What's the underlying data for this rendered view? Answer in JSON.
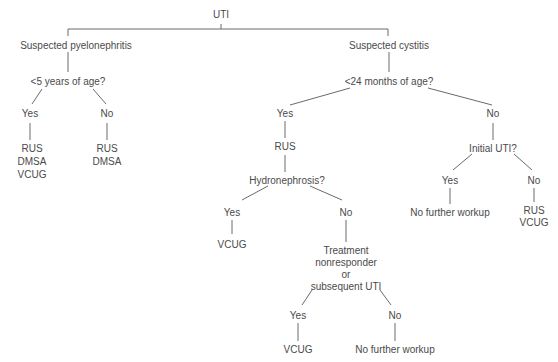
{
  "diagram": {
    "type": "decision-tree",
    "root": "UTI",
    "nodes": {
      "root": "UTI",
      "pyelo": "Suspected pyelonephritis",
      "pyelo_q": "<5 years of age?",
      "pyelo_yes": "Yes",
      "pyelo_yes_r1": "RUS",
      "pyelo_yes_r2": "DMSA",
      "pyelo_yes_r3": "VCUG",
      "pyelo_no": "No",
      "pyelo_no_r1": "RUS",
      "pyelo_no_r2": "DMSA",
      "cyst": "Suspected cystitis",
      "cyst_q": "<24 months of age?",
      "cyst_yes": "Yes",
      "cyst_yes_rus": "RUS",
      "hydro_q": "Hydronephrosis?",
      "hydro_yes": "Yes",
      "hydro_yes_r": "VCUG",
      "hydro_no": "No",
      "treat_1": "Treatment",
      "treat_2": "nonresponder",
      "treat_3": "or",
      "treat_4": "subsequent UTI",
      "treat_yes": "Yes",
      "treat_yes_r": "VCUG",
      "treat_no": "No",
      "treat_no_r": "No further workup",
      "cyst_no": "No",
      "initial_q": "Initial UTI?",
      "initial_yes": "Yes",
      "initial_yes_r": "No further workup",
      "initial_no": "No",
      "initial_no_r1": "RUS",
      "initial_no_r2": "VCUG"
    }
  }
}
